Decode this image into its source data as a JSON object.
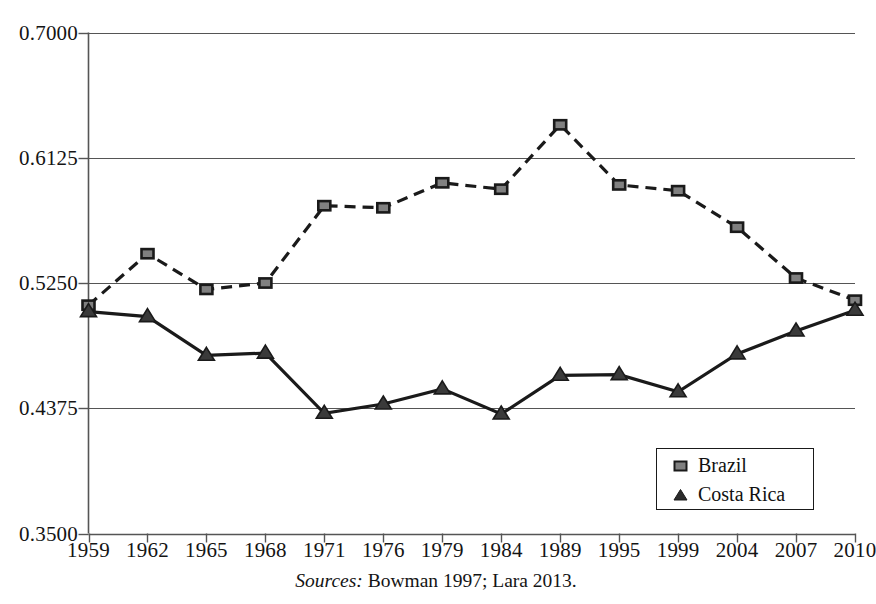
{
  "chart_data": {
    "type": "line",
    "title": "",
    "xlabel": "",
    "ylabel": "",
    "categories": [
      "1959",
      "1962",
      "1965",
      "1968",
      "1971",
      "1976",
      "1979",
      "1984",
      "1989",
      "1995",
      "1999",
      "2004",
      "2007",
      "2010"
    ],
    "yticks": [
      "0.7000",
      "0.6125",
      "0.5250",
      "0.4375",
      "0.3500"
    ],
    "ytick_values": [
      0.7,
      0.6125,
      0.525,
      0.4375,
      0.35
    ],
    "ylim": [
      0.35,
      0.7
    ],
    "grid": true,
    "legend_position": "lower right",
    "series": [
      {
        "name": "Brazil",
        "marker": "square",
        "linestyle": "dashed",
        "color": "#1a1a1a",
        "marker_fill": "#808080",
        "values": [
          0.5095,
          0.5455,
          0.5205,
          0.525,
          0.579,
          0.5775,
          0.595,
          0.5905,
          0.6355,
          0.5935,
          0.5895,
          0.564,
          0.5285,
          0.513
        ]
      },
      {
        "name": "Costa Rica",
        "marker": "triangle",
        "linestyle": "solid",
        "color": "#1a1a1a",
        "marker_fill": "#3a3a3a",
        "values": [
          0.505,
          0.5015,
          0.4745,
          0.476,
          0.434,
          0.4405,
          0.451,
          0.4335,
          0.4605,
          0.461,
          0.449,
          0.4755,
          0.4915,
          0.506
        ]
      }
    ],
    "annotations": {
      "source_label": "Sources:",
      "source_text": "Bowman 1997; Lara 2013."
    }
  },
  "legend": {
    "items": [
      {
        "label": "Brazil",
        "marker": "square-marker-icon"
      },
      {
        "label": "Costa Rica",
        "marker": "triangle-marker-icon"
      }
    ]
  }
}
